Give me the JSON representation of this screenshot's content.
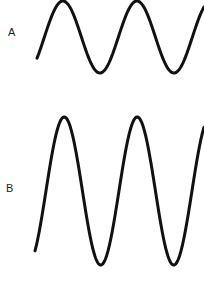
{
  "diagram": {
    "waves": [
      {
        "label": "A",
        "description": "Lower amplitude sine wave",
        "label_pos": [
          8,
          26
        ],
        "start_x": 37,
        "end_x": 204,
        "center_y": 37,
        "amplitude": 36,
        "period": 74,
        "phase_start_x": 37,
        "phase_offset": 0.4
      },
      {
        "label": "B",
        "description": "Higher amplitude sine wave (same frequency)",
        "label_pos": [
          6,
          182
        ],
        "start_x": 35,
        "end_x": 204,
        "center_y": 191,
        "amplitude": 74,
        "period": 73,
        "phase_start_x": 35,
        "phase_offset": 0.35
      }
    ],
    "stroke_color": "#111111",
    "stroke_width": 3
  }
}
